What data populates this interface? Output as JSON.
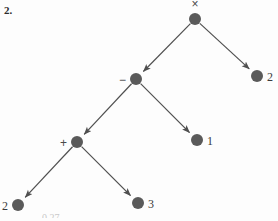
{
  "page": {
    "exercise_number": "2.",
    "background_color": "#fdfdfd",
    "width": 278,
    "height": 221,
    "bottom_cut_text": "0.27"
  },
  "diagram": {
    "type": "expression-tree",
    "node_color": "#5a5a5a",
    "node_radius": 6,
    "edge_color": "#4f4f4f",
    "edge_width": 1.2,
    "label_color": "#3a3a3a",
    "nodes": [
      {
        "id": "root",
        "label": "×",
        "label_position": "above",
        "cx": 195,
        "cy": 19,
        "kind": "operator"
      },
      {
        "id": "times-r",
        "label": "2",
        "label_position": "right",
        "cx": 257,
        "cy": 76,
        "kind": "leaf"
      },
      {
        "id": "minus",
        "label": "−",
        "label_position": "left",
        "cx": 136,
        "cy": 79,
        "kind": "operator"
      },
      {
        "id": "minus-r",
        "label": "1",
        "label_position": "right",
        "cx": 197,
        "cy": 140,
        "kind": "leaf"
      },
      {
        "id": "plus",
        "label": "+",
        "label_position": "left",
        "cx": 77,
        "cy": 142,
        "kind": "operator"
      },
      {
        "id": "plus-l",
        "label": "2",
        "label_position": "left",
        "cx": 18,
        "cy": 205,
        "kind": "leaf"
      },
      {
        "id": "plus-r",
        "label": "3",
        "label_position": "right",
        "cx": 138,
        "cy": 203,
        "kind": "leaf"
      }
    ],
    "edges": [
      {
        "id": "root-to-minus",
        "from": "root",
        "to": "minus",
        "arrow": true
      },
      {
        "id": "root-to-two",
        "from": "root",
        "to": "times-r",
        "arrow": true
      },
      {
        "id": "minus-to-plus",
        "from": "minus",
        "to": "plus",
        "arrow": true
      },
      {
        "id": "minus-to-one",
        "from": "minus",
        "to": "minus-r",
        "arrow": true
      },
      {
        "id": "plus-to-two",
        "from": "plus",
        "to": "plus-l",
        "arrow": true
      },
      {
        "id": "plus-to-three",
        "from": "plus",
        "to": "plus-r",
        "arrow": true
      }
    ]
  }
}
